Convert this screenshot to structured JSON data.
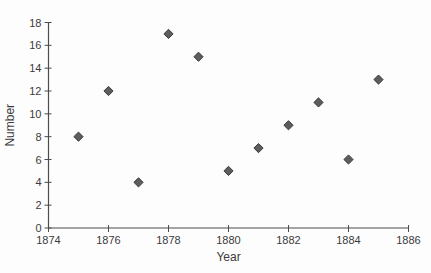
{
  "chart_data": {
    "type": "scatter",
    "xlabel": "Year",
    "ylabel": "Number",
    "x": [
      1875,
      1876,
      1877,
      1878,
      1879,
      1880,
      1881,
      1882,
      1883,
      1884,
      1885
    ],
    "y": [
      8,
      12,
      4,
      17,
      15,
      5,
      7,
      9,
      11,
      6,
      13
    ],
    "xlim": [
      1874,
      1886
    ],
    "ylim": [
      0,
      18
    ],
    "x_tick_step": 2,
    "y_tick_step": 2,
    "x_ticks": [
      1874,
      1876,
      1878,
      1880,
      1882,
      1884,
      1886
    ],
    "y_ticks": [
      0,
      2,
      4,
      6,
      8,
      10,
      12,
      14,
      16,
      18
    ],
    "grid": false,
    "legend": "none",
    "marker": "diamond",
    "colors": {
      "marker_fill": "#5d5d5d",
      "marker_stroke": "#3a3a3a",
      "axis": "#4c4c4c",
      "text": "#3b3b3b",
      "background": "#fdfdfd"
    }
  }
}
